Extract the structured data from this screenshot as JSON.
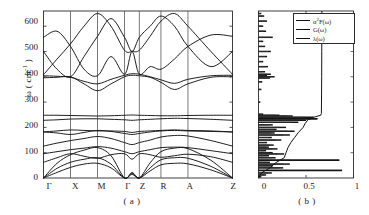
{
  "figure": {
    "panel_a": {
      "caption": "( a )",
      "ylabel_main": "ω (  cm",
      "ylabel_sup": "-1",
      "ylabel_tail": " )",
      "yticks": [
        "0",
        "100",
        "200",
        "300",
        "400",
        "500",
        "600"
      ],
      "xticks": [
        "Γ",
        "X",
        "M",
        "Γ",
        "Z",
        "R",
        "A",
        "Z"
      ]
    },
    "panel_b": {
      "caption": "( b )",
      "xticks": [
        "0",
        "0.5",
        "1"
      ],
      "legend": [
        {
          "name": "alpha2F-series",
          "label_main": "α",
          "label_sup": "2",
          "label_tail": "F(ω)",
          "color": "#111111"
        },
        {
          "name": "G-series",
          "label_main": "G(ω)",
          "label_sup": "",
          "label_tail": "",
          "color": "#111111"
        },
        {
          "name": "lambda-series",
          "label_main": "λ(ω)",
          "label_sup": "",
          "label_tail": "",
          "color": "#111111"
        }
      ]
    }
  },
  "chart_data": [
    {
      "type": "line",
      "name": "phonon-band-structure",
      "title": "",
      "xlabel": "",
      "ylabel": "ω ( cm^-1 )",
      "ylim": [
        0,
        660
      ],
      "xlim": [
        0,
        7
      ],
      "grid": true,
      "categories": [
        "Γ",
        "X",
        "M",
        "Γ",
        "Z",
        "R",
        "A",
        "Z"
      ],
      "high_symmetry_x": [
        0,
        1,
        2,
        3,
        3.55,
        4.35,
        5.35,
        7
      ],
      "note": "Phonon dispersion; 12 branches; acoustic branches start at 0 at Γ and Z.",
      "series": [
        {
          "name": "branch-1",
          "x": [
            0,
            0.5,
            1,
            1.5,
            2,
            2.5,
            3,
            3.28,
            3.55,
            3.95,
            4.35,
            4.85,
            5.35,
            6.2,
            7
          ],
          "values": [
            0,
            22,
            42,
            55,
            58,
            40,
            0,
            14,
            0,
            28,
            52,
            58,
            56,
            32,
            0
          ]
        },
        {
          "name": "branch-2",
          "x": [
            0,
            0.5,
            1,
            1.5,
            2,
            2.5,
            3,
            3.28,
            3.55,
            3.95,
            4.35,
            4.85,
            5.35,
            6.2,
            7
          ],
          "values": [
            0,
            38,
            62,
            74,
            80,
            55,
            0,
            18,
            0,
            40,
            72,
            80,
            78,
            46,
            0
          ]
        },
        {
          "name": "branch-3",
          "x": [
            0,
            0.5,
            1,
            1.5,
            2,
            2.5,
            3,
            3.28,
            3.55,
            3.95,
            4.35,
            4.85,
            5.35,
            6.2,
            7
          ],
          "values": [
            0,
            58,
            92,
            110,
            120,
            88,
            0,
            22,
            0,
            60,
            104,
            118,
            116,
            70,
            0
          ]
        },
        {
          "name": "branch-4",
          "x": [
            0,
            0.5,
            1,
            1.5,
            2,
            2.5,
            3,
            3.28,
            3.55,
            3.95,
            4.35,
            4.85,
            5.35,
            6.2,
            7
          ],
          "values": [
            62,
            80,
            96,
            86,
            78,
            92,
            96,
            74,
            96,
            92,
            82,
            88,
            94,
            84,
            62
          ]
        },
        {
          "name": "branch-5",
          "x": [
            0,
            0.5,
            1,
            1.5,
            2,
            2.5,
            3,
            3.28,
            3.55,
            3.95,
            4.35,
            4.85,
            5.35,
            6.2,
            7
          ],
          "values": [
            96,
            104,
            112,
            118,
            124,
            118,
            104,
            96,
            104,
            112,
            120,
            122,
            120,
            108,
            96
          ]
        },
        {
          "name": "branch-6",
          "x": [
            0,
            0.5,
            1,
            1.5,
            2,
            2.5,
            3,
            3.28,
            3.55,
            3.95,
            4.35,
            4.85,
            5.35,
            6.2,
            7
          ],
          "values": [
            126,
            138,
            148,
            156,
            164,
            156,
            140,
            132,
            140,
            150,
            162,
            168,
            166,
            148,
            126
          ]
        },
        {
          "name": "branch-7",
          "x": [
            0,
            0.5,
            1,
            1.5,
            2,
            2.5,
            3,
            3.28,
            3.55,
            3.95,
            4.35,
            4.85,
            5.35,
            6.2,
            7
          ],
          "values": [
            182,
            178,
            172,
            180,
            188,
            184,
            176,
            172,
            176,
            182,
            186,
            188,
            186,
            184,
            182
          ]
        },
        {
          "name": "branch-8",
          "x": [
            0,
            0.5,
            1,
            1.5,
            2,
            2.5,
            3,
            3.28,
            3.55,
            3.95,
            4.35,
            4.85,
            5.35,
            6.2,
            7
          ],
          "values": [
            182,
            186,
            190,
            188,
            186,
            186,
            184,
            180,
            184,
            186,
            188,
            190,
            188,
            186,
            182
          ]
        },
        {
          "name": "branch-9",
          "x": [
            0,
            0.5,
            1,
            1.5,
            2,
            2.5,
            3,
            3.28,
            3.55,
            3.95,
            4.35,
            4.85,
            5.35,
            6.2,
            7
          ],
          "values": [
            228,
            230,
            233,
            234,
            234,
            232,
            230,
            228,
            230,
            232,
            234,
            236,
            235,
            232,
            228
          ]
        },
        {
          "name": "branch-10",
          "x": [
            0,
            0.5,
            1,
            1.5,
            2,
            2.5,
            3,
            3.28,
            3.55,
            3.95,
            4.35,
            4.85,
            5.35,
            6.2,
            7
          ],
          "values": [
            248,
            248,
            247,
            246,
            245,
            246,
            248,
            249,
            248,
            247,
            246,
            246,
            247,
            248,
            248
          ]
        },
        {
          "name": "branch-11",
          "x": [
            0,
            0.5,
            1,
            1.5,
            2,
            2.5,
            3,
            3.28,
            3.55,
            3.95,
            4.35,
            4.85,
            5.35,
            6.2,
            7
          ],
          "values": [
            396,
            398,
            400,
            372,
            345,
            372,
            400,
            406,
            404,
            398,
            378,
            350,
            372,
            398,
            400
          ]
        },
        {
          "name": "branch-12",
          "x": [
            0,
            0.5,
            1,
            1.5,
            2,
            2.5,
            3,
            3.28,
            3.55,
            3.95,
            4.35,
            4.85,
            5.35,
            6.2,
            7
          ],
          "values": [
            404,
            402,
            398,
            382,
            372,
            390,
            406,
            412,
            410,
            400,
            388,
            374,
            390,
            404,
            406
          ]
        },
        {
          "name": "branch-13",
          "x": [
            0,
            0.5,
            1,
            1.5,
            2,
            2.5,
            3,
            3.28,
            3.55,
            3.95,
            4.35,
            4.85,
            5.35,
            6.2,
            7
          ],
          "values": [
            408,
            470,
            530,
            600,
            650,
            600,
            505,
            500,
            505,
            560,
            620,
            650,
            600,
            500,
            410
          ]
        },
        {
          "name": "branch-14",
          "x": [
            0,
            0.5,
            1,
            1.5,
            2,
            2.5,
            3,
            3.28,
            3.55,
            3.95,
            4.35,
            4.85,
            5.35,
            6.2,
            7
          ],
          "values": [
            500,
            430,
            400,
            480,
            560,
            630,
            556,
            500,
            556,
            600,
            640,
            600,
            520,
            440,
            500
          ]
        },
        {
          "name": "branch-15",
          "x": [
            0,
            0.5,
            1,
            1.5,
            2,
            2.5,
            3,
            3.28,
            3.55,
            3.95,
            4.35,
            4.85,
            5.35,
            6.2,
            7
          ],
          "values": [
            556,
            580,
            520,
            430,
            404,
            480,
            410,
            500,
            410,
            440,
            430,
            470,
            520,
            565,
            560
          ]
        }
      ]
    },
    {
      "type": "line",
      "name": "eliashberg-and-dos",
      "title": "",
      "xlabel": "",
      "ylabel": "ω ( cm^-1 )",
      "xlim": [
        0,
        1
      ],
      "ylim": [
        0,
        660
      ],
      "grid": true,
      "xticks": [
        0,
        0.5,
        1
      ],
      "orientation": "horizontal-spectra-vs-frequency",
      "legend_position": "top-right",
      "series": [
        {
          "name": "alpha2F(ω)",
          "label": "α2F(ω)",
          "omega": [
            5,
            12,
            20,
            30,
            40,
            48,
            55,
            62,
            70,
            80,
            88,
            95,
            100,
            108,
            115,
            122,
            130,
            140,
            150,
            160,
            170,
            178,
            185,
            192,
            200,
            210,
            220,
            228,
            234,
            240,
            245,
            248,
            252,
            300,
            350,
            380,
            395,
            400,
            405,
            410,
            420,
            440,
            460,
            480,
            500,
            520,
            540,
            556,
            580,
            600,
            620,
            640,
            650
          ],
          "values": [
            0.02,
            0.06,
            0.1,
            0.3,
            0.22,
            0.12,
            0.26,
            0.09,
            0.33,
            0.14,
            0.08,
            0.2,
            0.11,
            0.06,
            0.15,
            0.08,
            0.12,
            0.07,
            0.18,
            0.1,
            0.26,
            0.13,
            0.3,
            0.15,
            0.22,
            0.11,
            0.35,
            0.42,
            0.55,
            0.5,
            0.3,
            0.18,
            0.04,
            0.01,
            0.02,
            0.03,
            0.09,
            0.13,
            0.07,
            0.1,
            0.05,
            0.08,
            0.04,
            0.07,
            0.1,
            0.05,
            0.04,
            0.12,
            0.06,
            0.04,
            0.07,
            0.05,
            0.02
          ]
        },
        {
          "name": "G(ω)",
          "label": "G(ω)",
          "omega": [
            5,
            12,
            20,
            30,
            40,
            48,
            55,
            62,
            70,
            80,
            88,
            95,
            100,
            108,
            115,
            122,
            130,
            140,
            150,
            160,
            170,
            178,
            185,
            192,
            200,
            210,
            220,
            228,
            234,
            240,
            245,
            248,
            252,
            300,
            350,
            380,
            395,
            400,
            405,
            410,
            420,
            440,
            460,
            480,
            500,
            520,
            540,
            556,
            580,
            600,
            620,
            640,
            650
          ],
          "values": [
            0.03,
            0.08,
            0.14,
            0.88,
            0.26,
            0.15,
            0.33,
            0.12,
            0.85,
            0.18,
            0.11,
            0.27,
            0.15,
            0.08,
            0.2,
            0.11,
            0.16,
            0.09,
            0.24,
            0.14,
            0.33,
            0.17,
            0.38,
            0.19,
            0.29,
            0.15,
            0.42,
            0.5,
            0.62,
            0.58,
            0.36,
            0.22,
            0.05,
            0.02,
            0.03,
            0.04,
            0.12,
            0.17,
            0.09,
            0.13,
            0.07,
            0.1,
            0.05,
            0.09,
            0.13,
            0.07,
            0.05,
            0.15,
            0.08,
            0.05,
            0.09,
            0.06,
            0.03
          ]
        },
        {
          "name": "λ(ω)",
          "label": "λ(ω)",
          "omega": [
            0,
            20,
            40,
            60,
            80,
            100,
            110,
            120,
            140,
            160,
            180,
            200,
            215,
            230,
            240,
            248,
            255,
            300,
            400,
            500,
            600,
            660
          ],
          "values": [
            0.0,
            0.03,
            0.12,
            0.18,
            0.27,
            0.29,
            0.3,
            0.31,
            0.34,
            0.38,
            0.42,
            0.47,
            0.49,
            0.52,
            0.58,
            0.655,
            0.662,
            0.663,
            0.665,
            0.666,
            0.667,
            0.667
          ]
        }
      ]
    }
  ]
}
